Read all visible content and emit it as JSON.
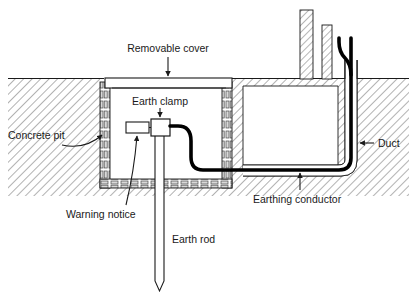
{
  "diagram": {
    "type": "engineering-cross-section",
    "background_color": "#ffffff",
    "line_color": "#1a1a1a",
    "conductor_color": "#000000",
    "hatch_color": "#6b6b6b",
    "labels": {
      "removable_cover": "Removable cover",
      "earth_clamp": "Earth clamp",
      "concrete_pit": "Concrete pit",
      "warning_notice": "Warning notice",
      "earth_rod": "Earth rod",
      "earthing_conductor": "Earthing conductor",
      "duct": "Duct"
    },
    "parts": [
      {
        "id": "removable-cover",
        "label": "Removable cover",
        "leader": "arrow-down"
      },
      {
        "id": "earth-clamp",
        "label": "Earth clamp",
        "leader": "arrow-down"
      },
      {
        "id": "concrete-pit",
        "label": "Concrete pit",
        "leader": "curved-arrow-right"
      },
      {
        "id": "warning-notice",
        "label": "Warning notice",
        "leader": "curved-arrow-up-right"
      },
      {
        "id": "earth-rod",
        "label": "Earth rod",
        "leader": "none"
      },
      {
        "id": "earthing-conductor",
        "label": "Earthing conductor",
        "leader": "arrow-up"
      },
      {
        "id": "duct",
        "label": "Duct",
        "leader": "arrow-left"
      }
    ]
  }
}
